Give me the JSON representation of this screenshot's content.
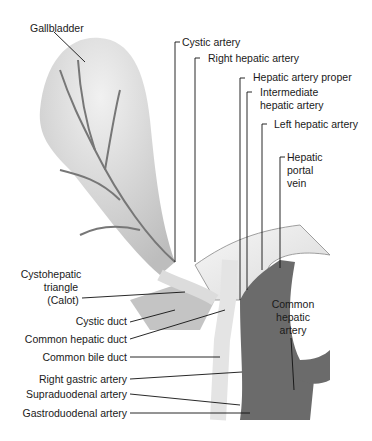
{
  "diagram": {
    "labels": {
      "gallbladder": "Gallbladder",
      "cystic_artery": "Cystic artery",
      "right_hepatic_artery": "Right hepatic artery",
      "hepatic_artery_proper": "Hepatic artery proper",
      "intermediate_hepatic_artery_1": "Intermediate",
      "intermediate_hepatic_artery_2": "hepatic artery",
      "left_hepatic_artery": "Left hepatic artery",
      "hepatic_portal_vein_1": "Hepatic",
      "hepatic_portal_vein_2": "portal",
      "hepatic_portal_vein_3": "vein",
      "cystohepatic_triangle_1": "Cystohepatic",
      "cystohepatic_triangle_2": "triangle",
      "cystohepatic_triangle_3": "(Calot)",
      "cystic_duct": "Cystic duct",
      "common_hepatic_duct": "Common hepatic duct",
      "common_bile_duct": "Common bile duct",
      "right_gastric_artery": "Right gastric artery",
      "supraduodenal_artery": "Supraduodenal artery",
      "gastroduodenal_artery": "Gastroduodenal artery",
      "common_hepatic_artery_1": "Common",
      "common_hepatic_artery_2": "hepatic",
      "common_hepatic_artery_3": "artery"
    },
    "colors": {
      "background": "#ffffff",
      "gallbladder": "#d6d6d6",
      "duct": "#e2e2e2",
      "artery": "#6a6a6a",
      "vein": "#555555",
      "leader": "#111111"
    }
  }
}
